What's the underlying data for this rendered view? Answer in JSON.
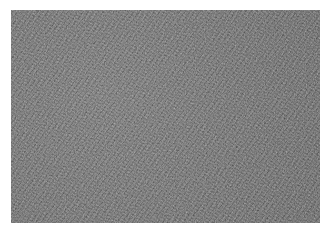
{
  "image": {
    "description": "Grayscale micrograph of densely packed fibrous / elongated cell texture",
    "colors": {
      "base": "#6a6a6a",
      "light": "#b0b0b0",
      "dark": "#2e2e2e",
      "background": "#ffffff"
    }
  }
}
